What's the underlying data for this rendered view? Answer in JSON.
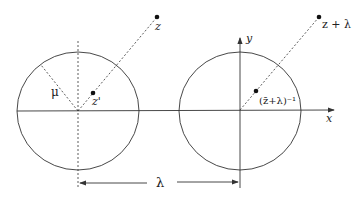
{
  "diagram": {
    "type": "geometric-construction",
    "colors": {
      "stroke": "#333333",
      "background": "#ffffff"
    },
    "left_figure": {
      "circle": {
        "cx": 78,
        "cy": 111,
        "rx": 61,
        "ry": 59
      },
      "labels": {
        "mu": "μ",
        "z": "z",
        "z_prime": "z'"
      }
    },
    "right_figure": {
      "circle": {
        "cx": 238,
        "cy": 111,
        "rx": 61,
        "ry": 59
      },
      "labels": {
        "z_plus_lambda": "z + λ",
        "inverse": "(z̄+λ)⁻¹",
        "x_axis": "x",
        "y_axis": "y"
      }
    },
    "dimension": {
      "label": "λ"
    }
  }
}
